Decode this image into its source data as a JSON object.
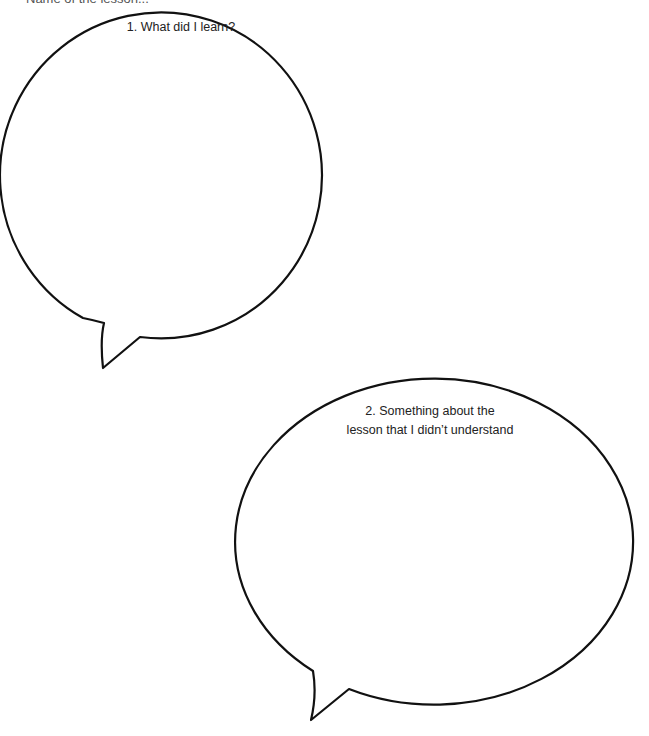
{
  "header": {
    "text": "Name of the lesson..."
  },
  "bubbles": [
    {
      "number": "1",
      "prompt": "1. What did I learn?"
    },
    {
      "number": "2",
      "prompt_line1": "2. Something about the",
      "prompt_line2": "lesson that I didn’t understand"
    }
  ],
  "colors": {
    "stroke": "#111111",
    "background": "#ffffff"
  }
}
